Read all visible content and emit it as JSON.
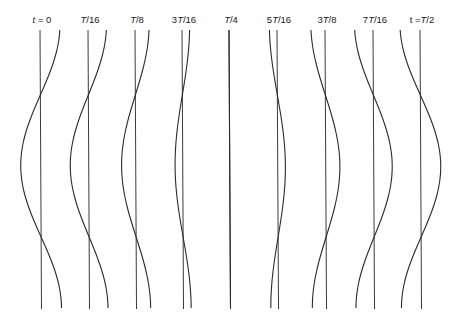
{
  "figure": {
    "line_color": "#2a2a2a",
    "panels": [
      {
        "label_prefix": "",
        "label_italic": "t",
        "label_suffix": " = 0",
        "label_full": "t = 0",
        "time_fraction": 0,
        "axis_x": 40
      },
      {
        "label_prefix": "",
        "label_italic": "T",
        "label_suffix": "/16",
        "label_full": "T/16",
        "time_fraction": 0.0625,
        "axis_x": 88
      },
      {
        "label_prefix": "",
        "label_italic": "T",
        "label_suffix": "/8",
        "label_full": "T/8",
        "time_fraction": 0.125,
        "axis_x": 135
      },
      {
        "label_prefix": "3",
        "label_italic": "T",
        "label_suffix": "/16",
        "label_full": "3T/16",
        "time_fraction": 0.1875,
        "axis_x": 182
      },
      {
        "label_prefix": "",
        "label_italic": "T",
        "label_suffix": "/4",
        "label_full": "T/4",
        "time_fraction": 0.25,
        "axis_x": 229
      },
      {
        "label_prefix": "5",
        "label_italic": "T",
        "label_suffix": "/16",
        "label_full": "5T/16",
        "time_fraction": 0.3125,
        "axis_x": 277
      },
      {
        "label_prefix": "3",
        "label_italic": "T",
        "label_suffix": "/8",
        "label_full": "3T/8",
        "time_fraction": 0.375,
        "axis_x": 325
      },
      {
        "label_prefix": "7",
        "label_italic": "T",
        "label_suffix": "/16",
        "label_full": "7T/16",
        "time_fraction": 0.4375,
        "axis_x": 373
      },
      {
        "label_prefix": "t =",
        "label_italic": "T",
        "label_suffix": "/2",
        "label_full": "t = T/2",
        "time_fraction": 0.5,
        "axis_x": 420
      }
    ],
    "amplitude_px": 20,
    "top_y": 30,
    "bottom_y": 309,
    "node_y": [
      95,
      237
    ]
  }
}
